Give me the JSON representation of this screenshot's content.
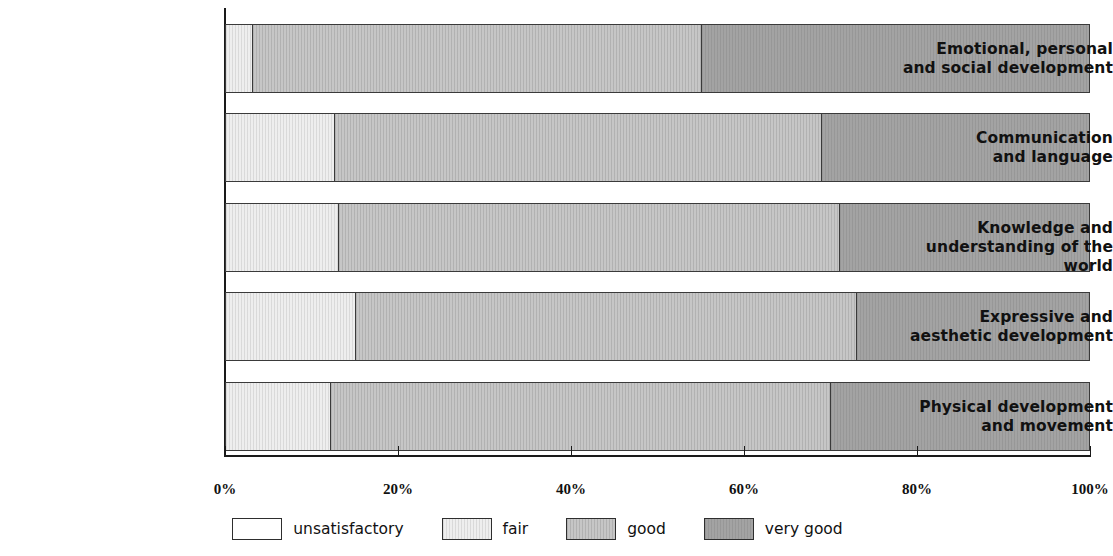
{
  "chart_data": {
    "type": "bar",
    "orientation": "horizontal",
    "stacked": true,
    "normalized": true,
    "title": "",
    "xlabel": "",
    "ylabel": "",
    "xlim": [
      0,
      100
    ],
    "grid": false,
    "legend_position": "bottom-center",
    "categories": [
      "Emotional, personal and social development",
      "Communication and language",
      "Knowledge and understanding of the world",
      "Expressive and aesthetic development",
      "Physical development and movement"
    ],
    "category_lines": [
      [
        "Emotional, personal",
        "and social development"
      ],
      [
        "Communication",
        "and language"
      ],
      [
        "Knowledge and",
        "understanding of the world"
      ],
      [
        "Expressive and",
        "aesthetic development"
      ],
      [
        "Physical development",
        "and movement"
      ]
    ],
    "series": [
      {
        "name": "unsatisfactory",
        "color": "#ffffff",
        "values": [
          0,
          0,
          0,
          0,
          0
        ]
      },
      {
        "name": "fair",
        "color": "#eeeeee",
        "values": [
          3,
          12.5,
          13,
          15,
          12
        ]
      },
      {
        "name": "good",
        "color": "#c6c6c6",
        "values": [
          52,
          56.5,
          58,
          58,
          58
        ]
      },
      {
        "name": "very good",
        "color": "#a3a3a3",
        "values": [
          45,
          31,
          29,
          27,
          30
        ]
      }
    ],
    "xticks": [
      0,
      20,
      40,
      60,
      80,
      100
    ],
    "xtick_labels": [
      "0%",
      "20%",
      "40%",
      "60%",
      "80%",
      "100%"
    ]
  },
  "legend": {
    "items": [
      {
        "label": "unsatisfactory",
        "swatch": "unsatisfactory"
      },
      {
        "label": "fair",
        "swatch": "fair"
      },
      {
        "label": "good",
        "swatch": "good"
      },
      {
        "label": "very good",
        "swatch": "verygood"
      }
    ]
  },
  "title_strip": ""
}
